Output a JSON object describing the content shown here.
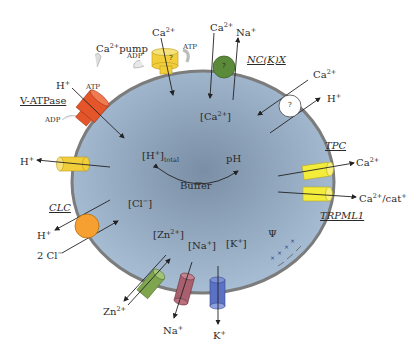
{
  "diagram": {
    "compartment": {
      "cx": 203,
      "cy": 182,
      "rx": 131,
      "ry": 111,
      "fill_center": "#7d93aa",
      "fill_edge": "#a9bfd6",
      "membrane": "#7a7a7a"
    },
    "colors": {
      "ca_pump": "#f2cf3a",
      "v_atpase": "#e5552a",
      "nckx": "#5b8a3a",
      "unknown_exchanger": "#ffffff",
      "h_channel": "#f2cf3a",
      "tpc": "#f4ec3a",
      "trpml1": "#f4ec3a",
      "clc": "#f6a032",
      "zn_transporter": "#7fa64e",
      "na_channel": "#a8606e",
      "k_channel": "#5b72c4"
    },
    "labels": {
      "ca_pump_name": "Ca",
      "ca_pump_sup": "2+",
      "ca_pump_suffix": "pump",
      "ca_pump_ion": "Ca",
      "ca_pump_ion_sup": "2+",
      "ca_pump_atp": "ATP",
      "ca_pump_adp": "ADP",
      "ca_pump_mark": "?",
      "nckx_name": "NC(K)X",
      "nckx_ca": "Ca",
      "nckx_ca_sup": "2+",
      "nckx_na": "Na",
      "nckx_na_sup": "+",
      "nckx_mark": "?",
      "vatpase_name": "V-ATPase",
      "vatpase_ion": "H",
      "vatpase_ion_sup": "+",
      "vatpase_atp": "ATP",
      "vatpase_adp": "ADP",
      "exch_ca": "Ca",
      "exch_ca_sup": "2+",
      "exch_h": "H",
      "exch_h_sup": "+",
      "exch_mark": "?",
      "h_leak": "H",
      "h_leak_sup": "+",
      "tpc_name": "TPC",
      "tpc_ion": "Ca",
      "tpc_ion_sup": "2+",
      "trpml1_name": "TRPML1",
      "trpml1_ion": "Ca",
      "trpml1_ion_sup": "2+",
      "trpml1_ion_suffix": "/cat",
      "trpml1_ion_suffix_sup": "+",
      "clc_name": "CLC",
      "clc_h": "H",
      "clc_h_sup": "+",
      "clc_cl": "2 Cl",
      "clc_cl_sup": "−",
      "zn_ion": "Zn",
      "zn_ion_sup": "2+",
      "na_ion": "Na",
      "na_ion_sup": "+",
      "k_ion": "K",
      "k_ion_sup": "+"
    },
    "lumen": {
      "ca": "[Ca",
      "ca_sup": "2+",
      "ca_close": "]",
      "h_total": "[H",
      "h_total_sup": "+",
      "h_total_close": "]",
      "h_total_sub": "total",
      "ph": "pH",
      "buffer": "Buffer",
      "cl": "[Cl",
      "cl_sup": "−",
      "cl_close": "]",
      "zn": "[Zn",
      "zn_sup": "2+",
      "zn_close": "]",
      "na": "[Na",
      "na_sup": "+",
      "na_close": "]",
      "k": "[K",
      "k_sup": "+",
      "k_close": "]",
      "psi": "Ψ",
      "charges_inside": "+ + + +",
      "charges_outside": "− − − −"
    }
  }
}
